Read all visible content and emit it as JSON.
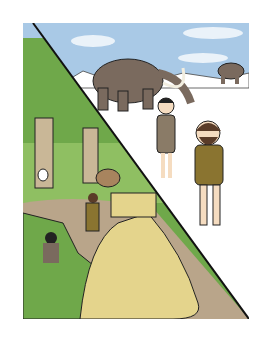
{
  "illustration": {
    "description": "Cartoon split-panel: left triangle forest with thatched pit dwelling, deer, rabbit and people; right triangle ice-age snowy scene with woolly mammoths and shivering cave people",
    "colors": {
      "sky": "#a9c9e6",
      "snow": "#ffffff",
      "forest": "#6fa84a",
      "forest_dark": "#4f8a35",
      "ground": "#b9a58a",
      "thatch": "#e4d48c",
      "mammoth": "#7a6a5e",
      "outline": "#222222"
    }
  }
}
